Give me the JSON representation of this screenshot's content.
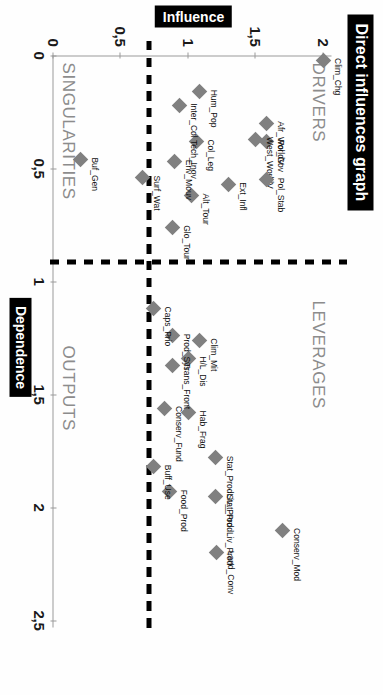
{
  "chart_title": "Direct influences graph",
  "axis_titles": {
    "x": "Dependence",
    "y": "Influence"
  },
  "quadrants": {
    "top_left": "DRIVERS",
    "top_right": "LEVERAGES",
    "bottom_left": "SINGULARITIES",
    "bottom_right": "OUTPUTS"
  },
  "chart_data": {
    "type": "scatter",
    "title": "Direct influences graph",
    "xlabel": "Dependence",
    "ylabel": "Influence",
    "xlim": [
      0,
      2.5
    ],
    "ylim": [
      0,
      2
    ],
    "grid": false,
    "legend": null,
    "xticks": [
      "0",
      "0,5",
      "1",
      "1,5",
      "2",
      "2,5"
    ],
    "xtick_values": [
      0,
      0.5,
      1,
      1.5,
      2,
      2.5
    ],
    "yticks": [
      "0",
      "0,5",
      "1",
      "1,5",
      "2"
    ],
    "ytick_values": [
      0,
      0.5,
      1,
      1.5,
      2
    ],
    "reference_lines": {
      "vertical_x": 1.0,
      "horizontal_y": 0.92
    },
    "marker": "diamond",
    "marker_color": "#808080",
    "points": [
      {
        "label": "Clim_Chg",
        "x": 0.02,
        "y": 2.0
      },
      {
        "label": "Afr_WorldV",
        "x": 0.3,
        "y": 1.58
      },
      {
        "label": "Pol_Gov",
        "x": 0.38,
        "y": 1.58
      },
      {
        "label": "West_WorldV",
        "x": 0.37,
        "y": 1.5
      },
      {
        "label": "Pol_Stab",
        "x": 0.55,
        "y": 1.58
      },
      {
        "label": "Ext_Infl",
        "x": 0.57,
        "y": 1.3
      },
      {
        "label": "Hum_Pop",
        "x": 0.16,
        "y": 1.08
      },
      {
        "label": "Col_Leg",
        "x": 0.38,
        "y": 1.06
      },
      {
        "label": "Alt_Tour",
        "x": 0.62,
        "y": 1.02
      },
      {
        "label": "Inter_Col Tech_Inov",
        "x": 0.22,
        "y": 0.93
      },
      {
        "label": "Env_Mouv",
        "x": 0.47,
        "y": 0.9
      },
      {
        "label": "Glo_Tour",
        "x": 0.76,
        "y": 0.88
      },
      {
        "label": "Surf_Wat",
        "x": 0.54,
        "y": 0.66
      },
      {
        "label": "Buf_Gen",
        "x": 0.46,
        "y": 0.2
      },
      {
        "label": "Clim_Mit",
        "x": 1.26,
        "y": 1.08
      },
      {
        "label": "H/L_Dis",
        "x": 1.34,
        "y": 1.0
      },
      {
        "label": "Hab_Frag",
        "x": 1.58,
        "y": 1.0
      },
      {
        "label": "Prod_Sys",
        "x": 1.24,
        "y": 0.88
      },
      {
        "label": "Trans_Front",
        "x": 1.37,
        "y": 0.88
      },
      {
        "label": "Conserv_Fund",
        "x": 1.56,
        "y": 0.82
      },
      {
        "label": "Caps_Prio",
        "x": 1.12,
        "y": 0.74
      },
      {
        "label": "Stat_ProdLiv_Prod",
        "x": 1.78,
        "y": 1.2
      },
      {
        "label": "Stat_ProdLiv_Prod",
        "x": 1.95,
        "y": 1.2
      },
      {
        "label": "Food_Prod",
        "x": 1.93,
        "y": 0.86
      },
      {
        "label": "Buff_Use",
        "x": 1.82,
        "y": 0.74
      },
      {
        "label": "Land_Conv",
        "x": 2.2,
        "y": 1.21
      },
      {
        "label": "Conserv_Mod",
        "x": 2.1,
        "y": 1.7
      }
    ]
  }
}
